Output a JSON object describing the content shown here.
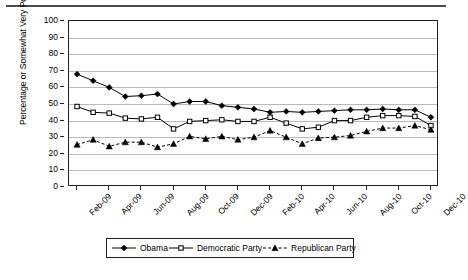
{
  "chart_data": {
    "type": "line",
    "title": "",
    "xlabel": "",
    "ylabel": "Percentage or Somewhat Very Positive",
    "ylim": [
      0,
      100
    ],
    "ytick_values": [
      0,
      10,
      20,
      30,
      40,
      50,
      60,
      70,
      80,
      90,
      100
    ],
    "grid": true,
    "legend_position": "bottom",
    "x": [
      "Feb-09",
      "Mar-09",
      "Apr-09",
      "May-09",
      "Jun-09",
      "Jul-09",
      "Aug-09",
      "Sep-09",
      "Oct-09",
      "Nov-09",
      "Dec-09",
      "Jan-10",
      "Feb-10",
      "Mar-10",
      "Apr-10",
      "May-10",
      "Jun-10",
      "Jul-10",
      "Aug-10",
      "Sep-10",
      "Oct-10",
      "Nov-10",
      "Dec-10"
    ],
    "xtick_labels": [
      "Feb-09",
      "Apr-09",
      "Jun-09",
      "Aug-09",
      "Oct-09",
      "Dec-09",
      "Feb-10",
      "Apr-10",
      "Jun-10",
      "Aug-10",
      "Oct-10",
      "Dec-10"
    ],
    "series": [
      {
        "name": "Obama",
        "marker": "filled-diamond",
        "linestyle": "solid",
        "color": "#000000",
        "values": [
          68,
          64,
          60,
          54.5,
          55,
          56,
          50,
          51.5,
          51.5,
          49,
          48,
          47,
          45,
          45.5,
          45,
          45.5,
          46,
          46.5,
          46.5,
          47,
          46.5,
          46.5,
          42
        ]
      },
      {
        "name": "Democratic Party",
        "marker": "open-square",
        "linestyle": "solid",
        "color": "#000000",
        "values": [
          48.5,
          45,
          44.5,
          41.5,
          41,
          42,
          35,
          39.5,
          40,
          40.5,
          39.5,
          39.5,
          42,
          38.5,
          35,
          36,
          40,
          40,
          42,
          43,
          43,
          42.5,
          37
        ]
      },
      {
        "name": "Republican Party",
        "marker": "filled-triangle",
        "linestyle": "dashed",
        "color": "#000000",
        "values": [
          25.5,
          28.5,
          24.5,
          27,
          27,
          24,
          26,
          30.5,
          29,
          30.5,
          28.5,
          30,
          34,
          30,
          26,
          29.5,
          30,
          31,
          33.5,
          35.5,
          35.5,
          37,
          34.5
        ]
      }
    ]
  },
  "legend": {
    "items": [
      {
        "label": "Obama",
        "marker": "filled-diamond",
        "linestyle": "solid"
      },
      {
        "label": "Democratic Party",
        "marker": "open-square",
        "linestyle": "solid"
      },
      {
        "label": "Republican Party",
        "marker": "filled-triangle",
        "linestyle": "dashed"
      }
    ]
  }
}
